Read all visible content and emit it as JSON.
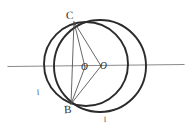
{
  "figure": {
    "kind": "geometry-diagram",
    "background_color": "#ffffff",
    "stroke_color": "#2b2b2b",
    "axis_color": "#7a7a7a",
    "thin_stroke_color": "#4a4a4a",
    "canvas": {
      "width": 192,
      "height": 133
    }
  },
  "labels": {
    "vertex_top": "C",
    "vertex_bottom": "B",
    "center_left": "O",
    "center_right": "O",
    "arc_left": "l",
    "arc_bottom": "l"
  },
  "geometry": {
    "axis_line": {
      "x1": 8,
      "y1": 66,
      "x2": 184,
      "y2": 64
    },
    "circle_large": {
      "cx": 100,
      "cy": 66,
      "r": 46,
      "label": "large-circle"
    },
    "circle_small": {
      "cx": 86,
      "cy": 64,
      "r": 42,
      "label": "small-circle"
    },
    "point_C": {
      "x": 74,
      "y": 22
    },
    "point_B": {
      "x": 71,
      "y": 104
    },
    "point_O1": {
      "x": 86,
      "y": 66
    },
    "point_O2": {
      "x": 101,
      "y": 66
    },
    "chords": [
      {
        "name": "C-to-O2",
        "from": "C",
        "to": "O2"
      },
      {
        "name": "B-to-O2",
        "from": "B",
        "to": "O2"
      },
      {
        "name": "C-to-B",
        "from": "C",
        "to": "B"
      },
      {
        "name": "C-to-O1",
        "from": "C",
        "to": "O1"
      },
      {
        "name": "B-to-O1",
        "from": "B",
        "to": "O1"
      }
    ]
  }
}
